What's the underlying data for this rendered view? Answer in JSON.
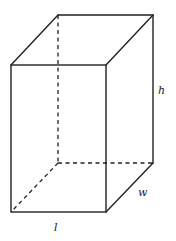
{
  "diagram": {
    "type": "rectangular-prism",
    "labels": {
      "height": "h",
      "width": "w",
      "length": "l"
    },
    "colors": {
      "stroke": "#222222",
      "background": "#ffffff"
    }
  }
}
